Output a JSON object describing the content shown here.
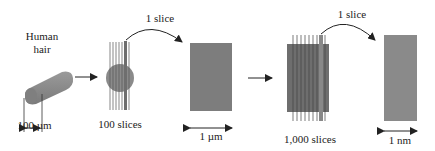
{
  "diagram": {
    "stages": [
      {
        "id": "hair",
        "label_line1": "Human",
        "label_line2": "hair",
        "dimension": "100 µm"
      },
      {
        "id": "hair-slices",
        "label": "100 slices"
      },
      {
        "id": "micron-slice",
        "dimension": "1 µm"
      },
      {
        "id": "micron-slices",
        "label": "1,000 slices"
      },
      {
        "id": "nano-slice",
        "dimension": "1 nm"
      }
    ],
    "arrows": [
      {
        "label": "1 slice"
      },
      {
        "label": "1 slice"
      }
    ],
    "colors": {
      "fill": "#8a8a8a",
      "dark_fill": "#6e6e6e",
      "line": "#333333"
    }
  }
}
